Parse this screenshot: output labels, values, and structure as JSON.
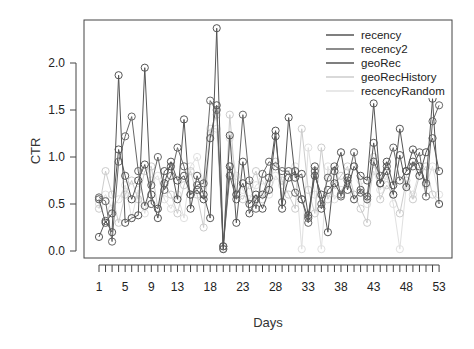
{
  "chart_data": {
    "type": "line",
    "title": "",
    "xlabel": "Days",
    "ylabel": "CTR",
    "ylim": [
      0,
      2.4
    ],
    "xlim": [
      1,
      53
    ],
    "grid": false,
    "legend_position": "top-right",
    "x": [
      1,
      2,
      3,
      4,
      5,
      6,
      7,
      8,
      9,
      10,
      11,
      12,
      13,
      14,
      15,
      16,
      17,
      18,
      19,
      20,
      21,
      22,
      23,
      24,
      25,
      26,
      27,
      28,
      29,
      30,
      31,
      32,
      33,
      34,
      35,
      36,
      37,
      38,
      39,
      40,
      41,
      42,
      43,
      44,
      45,
      46,
      47,
      48,
      49,
      50,
      51,
      52,
      53
    ],
    "x_tick_labels": [
      "1",
      "5",
      "9",
      "13",
      "18",
      "23",
      "28",
      "33",
      "38",
      "43",
      "48",
      "53"
    ],
    "x_tick_positions": [
      1,
      5,
      9,
      13,
      18,
      23,
      28,
      33,
      38,
      43,
      48,
      53
    ],
    "y_ticks": [
      0.0,
      0.5,
      1.0,
      1.5,
      2.0
    ],
    "y_tick_labels": [
      "0.0",
      "0.5",
      "1.0",
      "1.5",
      "2.0"
    ],
    "series": [
      {
        "name": "recency",
        "color": "#555555",
        "values": [
          0.15,
          0.32,
          0.2,
          1.87,
          0.3,
          0.35,
          0.38,
          1.95,
          0.5,
          0.45,
          0.85,
          0.9,
          0.55,
          1.4,
          0.45,
          0.8,
          0.6,
          0.35,
          2.37,
          0.02,
          1.23,
          0.3,
          0.95,
          0.4,
          0.55,
          0.6,
          0.78,
          1.28,
          0.45,
          1.42,
          0.78,
          0.82,
          0.38,
          0.8,
          0.6,
          0.2,
          0.85,
          1.05,
          0.65,
          0.9,
          0.8,
          0.75,
          1.57,
          0.72,
          0.95,
          0.7,
          1.3,
          0.85,
          1.08,
          0.9,
          0.72,
          1.62,
          0.5
        ]
      },
      {
        "name": "recency2",
        "color": "#666666",
        "values": [
          0.57,
          0.53,
          0.1,
          0.95,
          1.22,
          1.43,
          0.85,
          0.48,
          0.7,
          1.0,
          0.65,
          0.8,
          1.1,
          0.9,
          0.6,
          0.7,
          0.72,
          1.6,
          1.5,
          0.05,
          0.8,
          0.55,
          1.45,
          0.75,
          0.45,
          0.82,
          0.95,
          0.9,
          0.85,
          0.85,
          0.62,
          0.55,
          0.3,
          0.85,
          0.5,
          0.78,
          0.9,
          0.58,
          0.75,
          1.05,
          0.62,
          0.55,
          0.95,
          0.8,
          0.9,
          1.1,
          0.75,
          0.85,
          0.9,
          1.05,
          0.58,
          1.38,
          1.55
        ]
      },
      {
        "name": "geoRec",
        "color": "#555555",
        "values": [
          0.55,
          0.3,
          0.4,
          1.08,
          0.8,
          0.55,
          0.75,
          0.92,
          0.6,
          0.35,
          0.72,
          0.95,
          0.75,
          0.8,
          0.6,
          0.65,
          0.55,
          1.2,
          1.55,
          0.05,
          0.9,
          0.6,
          0.72,
          0.5,
          0.6,
          0.45,
          0.65,
          1.22,
          0.52,
          0.78,
          0.85,
          0.55,
          0.35,
          0.9,
          0.45,
          0.65,
          0.72,
          0.6,
          0.78,
          0.55,
          0.65,
          0.58,
          1.15,
          0.72,
          0.85,
          0.6,
          1.02,
          0.68,
          0.95,
          0.8,
          1.05,
          1.2,
          0.85
        ]
      },
      {
        "name": "geoRecHistory",
        "color": "#cccccc",
        "values": [
          0.45,
          0.85,
          0.6,
          0.3,
          0.6,
          0.75,
          0.55,
          0.85,
          0.9,
          0.45,
          0.7,
          0.6,
          0.4,
          0.7,
          0.85,
          0.6,
          0.25,
          1.25,
          1.45,
          0.02,
          1.45,
          0.6,
          0.55,
          0.7,
          0.85,
          0.55,
          0.72,
          0.95,
          0.75,
          0.6,
          0.45,
          1.3,
          0.65,
          0.4,
          1.1,
          0.55,
          0.7,
          0.8,
          0.9,
          0.6,
          0.45,
          0.3,
          1.0,
          0.55,
          0.7,
          0.6,
          0.4,
          0.75,
          0.55,
          0.8,
          0.9,
          0.6,
          0.5
        ]
      },
      {
        "name": "recencyRandom",
        "color": "#e0e0e0",
        "values": [
          0.5,
          0.6,
          0.45,
          0.55,
          0.7,
          0.35,
          0.65,
          0.4,
          0.75,
          0.8,
          0.55,
          0.45,
          0.6,
          0.35,
          0.9,
          1.0,
          0.7,
          1.3,
          1.3,
          0.03,
          1.2,
          0.8,
          0.65,
          0.55,
          0.7,
          0.75,
          0.6,
          0.8,
          0.7,
          0.85,
          0.9,
          0.02,
          1.1,
          0.6,
          0.02,
          0.9,
          0.55,
          0.65,
          0.7,
          0.9,
          0.75,
          0.5,
          0.85,
          0.65,
          0.8,
          0.5,
          0.02,
          0.7,
          0.6,
          0.85,
          0.7,
          0.9,
          0.6
        ]
      }
    ]
  }
}
